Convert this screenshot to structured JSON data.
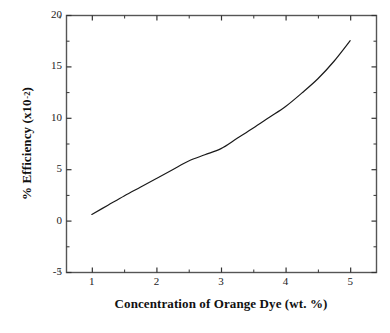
{
  "chart_data": {
    "type": "line",
    "title": "",
    "xlabel": "Concentration of Orange Dye (wt. %)",
    "ylabel": "% Efficiency (x10",
    "ylabel_superscript": "-2",
    "ylabel_close": ")",
    "xlim": [
      0.6,
      5.4
    ],
    "ylim": [
      -5,
      20
    ],
    "grid": false,
    "legend": null,
    "x_ticks": [
      1,
      2,
      3,
      4,
      5
    ],
    "x_tick_labels": [
      "1",
      "2",
      "3",
      "4",
      "5"
    ],
    "x_minor_ticks": [
      0.5,
      1.5,
      2.5,
      3.5,
      4.5
    ],
    "y_ticks": [
      -5,
      0,
      5,
      10,
      15,
      20
    ],
    "y_tick_labels": [
      "-5",
      "0",
      "5",
      "10",
      "15",
      "20"
    ],
    "y_minor_ticks": [
      -2.5,
      2.5,
      7.5,
      12.5,
      17.5
    ],
    "series": [
      {
        "name": "efficiency",
        "color": "#1a1a1a",
        "line_width": 1.2,
        "x": [
          1.0,
          1.25,
          1.5,
          1.75,
          2.0,
          2.25,
          2.5,
          2.75,
          3.0,
          3.25,
          3.5,
          3.75,
          4.0,
          4.25,
          4.5,
          4.75,
          5.0
        ],
        "y": [
          0.6,
          1.5,
          2.4,
          3.25,
          4.1,
          4.95,
          5.8,
          6.4,
          7.0,
          8.0,
          9.0,
          10.05,
          11.1,
          12.4,
          13.8,
          15.5,
          17.5
        ]
      }
    ],
    "axis_color": "#555555",
    "tick_color": "#333333",
    "background": "#ffffff"
  },
  "figure": {
    "plot_left": 66,
    "plot_right": 376,
    "plot_top": 15,
    "plot_bottom": 272
  }
}
